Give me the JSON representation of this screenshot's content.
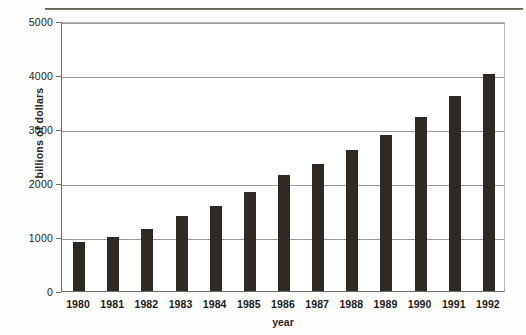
{
  "chart_data": {
    "type": "bar",
    "title": "",
    "subtitle": "",
    "xlabel": "year",
    "ylabel": "billions of dollars",
    "categories": [
      "1980",
      "1981",
      "1982",
      "1983",
      "1984",
      "1985",
      "1986",
      "1987",
      "1988",
      "1989",
      "1990",
      "1991",
      "1992"
    ],
    "values": [
      900,
      1000,
      1150,
      1380,
      1580,
      1840,
      2140,
      2360,
      2620,
      2890,
      3220,
      3620,
      4020
    ],
    "ylim": [
      0,
      5000
    ],
    "ytick_values": [
      0,
      1000,
      2000,
      3000,
      4000,
      5000
    ],
    "ytick_labels": [
      "0",
      "1000",
      "2000",
      "3000",
      "4000",
      "5000"
    ],
    "grid": true,
    "grid_axis": "y",
    "legend": false,
    "legend_position": "none",
    "bar_color": "#2e2922",
    "gridline_color": "#9a9894",
    "axis_color": "#6e6c68",
    "background_color": "#ffffff"
  }
}
